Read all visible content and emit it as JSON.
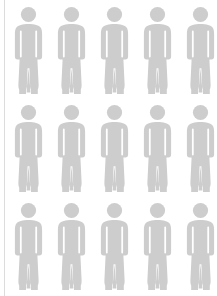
{
  "canvas": {
    "width": 217,
    "height": 296,
    "background_color": "#ffffff"
  },
  "graphic": {
    "kind": "pictogram-grid",
    "subject": "human-figure",
    "figure_color": "#cdcdcd",
    "rule_color": "#dcdcdc",
    "rows": 3,
    "columns": 5,
    "total_figures": 15,
    "column_pitch": 43,
    "row_pitch": 98,
    "first_column_x": 12,
    "row_tops": [
      6,
      104,
      202
    ],
    "figure_width": 33,
    "figure_height": 88,
    "bottom_row_clipped": true
  },
  "left_rule": {
    "x": 4,
    "width": 1
  },
  "figures": [
    {
      "row": 1,
      "column": 1,
      "icon": "person-icon"
    },
    {
      "row": 1,
      "column": 2,
      "icon": "person-icon"
    },
    {
      "row": 1,
      "column": 3,
      "icon": "person-icon"
    },
    {
      "row": 1,
      "column": 4,
      "icon": "person-icon"
    },
    {
      "row": 1,
      "column": 5,
      "icon": "person-icon"
    },
    {
      "row": 2,
      "column": 1,
      "icon": "person-icon"
    },
    {
      "row": 2,
      "column": 2,
      "icon": "person-icon"
    },
    {
      "row": 2,
      "column": 3,
      "icon": "person-icon"
    },
    {
      "row": 2,
      "column": 4,
      "icon": "person-icon"
    },
    {
      "row": 2,
      "column": 5,
      "icon": "person-icon"
    },
    {
      "row": 3,
      "column": 1,
      "icon": "person-icon"
    },
    {
      "row": 3,
      "column": 2,
      "icon": "person-icon"
    },
    {
      "row": 3,
      "column": 3,
      "icon": "person-icon"
    },
    {
      "row": 3,
      "column": 4,
      "icon": "person-icon"
    },
    {
      "row": 3,
      "column": 5,
      "icon": "person-icon"
    }
  ]
}
